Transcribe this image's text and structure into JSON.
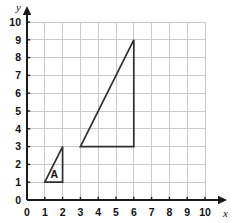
{
  "chart_data": {
    "type": "scatter",
    "title": "",
    "xlabel": "x",
    "ylabel": "y",
    "xlim": [
      0,
      10
    ],
    "ylim": [
      0,
      10
    ],
    "x_ticks": [
      "0",
      "1",
      "2",
      "3",
      "4",
      "5",
      "6",
      "7",
      "8",
      "9",
      "10"
    ],
    "y_ticks": [
      "0",
      "1",
      "2",
      "3",
      "4",
      "5",
      "6",
      "7",
      "8",
      "9",
      "10"
    ],
    "x_tick_values": [
      0,
      1,
      2,
      3,
      4,
      5,
      6,
      7,
      8,
      9,
      10
    ],
    "y_tick_values": [
      0,
      1,
      2,
      3,
      4,
      5,
      6,
      7,
      8,
      9,
      10
    ],
    "grid": true,
    "legend": "none",
    "shapes": [
      {
        "name": "triangle-a",
        "label": "A",
        "label_position": [
          1.55,
          1.45
        ],
        "vertices": [
          [
            1,
            1
          ],
          [
            2,
            1
          ],
          [
            2,
            3
          ]
        ],
        "closed": true,
        "fill": "none",
        "stroke": "#2f2f2f"
      },
      {
        "name": "triangle-enlarged",
        "label": "",
        "vertices": [
          [
            3,
            3
          ],
          [
            6,
            3
          ],
          [
            6,
            9
          ]
        ],
        "closed": true,
        "fill": "none",
        "stroke": "#2f2f2f"
      }
    ]
  },
  "axes": {
    "x_axis_label": "x",
    "y_axis_label": "y",
    "origin_label": "0"
  },
  "colors": {
    "grid": "#c9c9cf",
    "axis": "#1a1a1a",
    "shape_stroke": "#2f2f2f",
    "text": "#111111",
    "background": "#ffffff"
  }
}
